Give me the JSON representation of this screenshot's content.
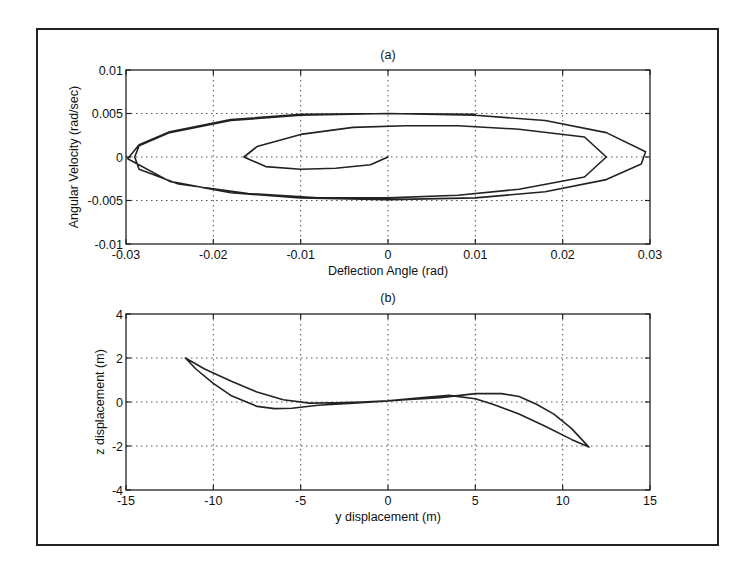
{
  "figure": {
    "panel_a_title": "(a)",
    "panel_b_title": "(b)"
  },
  "chart_data": [
    {
      "type": "line",
      "title": "(a)",
      "xlabel": "Deflection Angle (rad)",
      "ylabel": "Angular Velocity (rad/sec)",
      "xlim": [
        -0.03,
        0.03
      ],
      "ylim": [
        -0.01,
        0.01
      ],
      "xticks": [
        "-0.03",
        "-0.02",
        "-0.01",
        "0",
        "0.01",
        "0.02",
        "0.03"
      ],
      "yticks": [
        "0.01",
        "0.005",
        "0",
        "-0.005",
        "-0.01"
      ],
      "grid": true,
      "legend": null,
      "series": [
        {
          "name": "phase-plane trajectory (spiral out to limit cycle)",
          "points": [
            [
              0,
              0
            ],
            [
              -0.002,
              -0.0009
            ],
            [
              -0.006,
              -0.0013
            ],
            [
              -0.01,
              -0.0014
            ],
            [
              -0.014,
              -0.0011
            ],
            [
              -0.0165,
              0
            ],
            [
              -0.015,
              0.0012
            ],
            [
              -0.01,
              0.0026
            ],
            [
              -0.004,
              0.0034
            ],
            [
              0.002,
              0.0036
            ],
            [
              0.008,
              0.0036
            ],
            [
              0.015,
              0.0032
            ],
            [
              0.0225,
              0.0023
            ],
            [
              0.025,
              0
            ],
            [
              0.0225,
              -0.0023
            ],
            [
              0.015,
              -0.0037
            ],
            [
              0.008,
              -0.0044
            ],
            [
              0.0,
              -0.0047
            ],
            [
              -0.008,
              -0.0047
            ],
            [
              -0.016,
              -0.0042
            ],
            [
              -0.024,
              -0.0031
            ],
            [
              -0.0285,
              -0.0014
            ],
            [
              -0.029,
              0
            ],
            [
              -0.0285,
              0.0013
            ],
            [
              -0.025,
              0.0028
            ],
            [
              -0.018,
              0.0042
            ],
            [
              -0.01,
              0.0048
            ],
            [
              0.0,
              0.005
            ],
            [
              0.01,
              0.0048
            ],
            [
              0.018,
              0.0042
            ],
            [
              0.025,
              0.0028
            ],
            [
              0.0295,
              0.0006
            ],
            [
              0.029,
              -0.0008
            ],
            [
              0.025,
              -0.0026
            ],
            [
              0.018,
              -0.004
            ],
            [
              0.01,
              -0.0047
            ],
            [
              0.0,
              -0.0049
            ],
            [
              -0.01,
              -0.0047
            ],
            [
              -0.018,
              -0.0041
            ],
            [
              -0.025,
              -0.0028
            ],
            [
              -0.0298,
              -0.0002
            ],
            [
              -0.0285,
              0.0014
            ],
            [
              -0.025,
              0.0029
            ],
            [
              -0.018,
              0.0043
            ],
            [
              -0.01,
              0.0049
            ],
            [
              0.0,
              0.005
            ],
            [
              0.01,
              0.0049
            ]
          ]
        }
      ]
    },
    {
      "type": "line",
      "title": "(b)",
      "xlabel": "y displacement (m)",
      "ylabel": "z displacement (m)",
      "xlim": [
        -15,
        15
      ],
      "ylim": [
        -4,
        4
      ],
      "xticks": [
        "-15",
        "-10",
        "-5",
        "0",
        "5",
        "10",
        "15"
      ],
      "yticks": [
        "4",
        "2",
        "0",
        "-2",
        "-4"
      ],
      "grid": true,
      "legend": null,
      "series": [
        {
          "name": "y-z trajectory (closed loop, traced multiple times)",
          "points": [
            [
              -11.6,
              2.0
            ],
            [
              -10.5,
              1.5
            ],
            [
              -9,
              0.95
            ],
            [
              -7.5,
              0.45
            ],
            [
              -6,
              0.1
            ],
            [
              -4.5,
              -0.05
            ],
            [
              -3,
              -0.03
            ],
            [
              -1.5,
              0.0
            ],
            [
              0,
              0.05
            ],
            [
              2,
              0.2
            ],
            [
              3.5,
              0.3
            ],
            [
              5,
              0.15
            ],
            [
              6,
              -0.1
            ],
            [
              7.5,
              -0.55
            ],
            [
              9,
              -1.1
            ],
            [
              10.5,
              -1.7
            ],
            [
              11.5,
              -2.05
            ],
            [
              10.5,
              -1.2
            ],
            [
              9.5,
              -0.55
            ],
            [
              8.5,
              -0.1
            ],
            [
              7.5,
              0.25
            ],
            [
              6.5,
              0.38
            ],
            [
              5,
              0.38
            ],
            [
              3,
              0.2
            ],
            [
              1,
              0.1
            ],
            [
              0,
              0.05
            ],
            [
              -2,
              -0.05
            ],
            [
              -4,
              -0.15
            ],
            [
              -5.5,
              -0.28
            ],
            [
              -6.5,
              -0.3
            ],
            [
              -7.5,
              -0.2
            ],
            [
              -9,
              0.3
            ],
            [
              -10,
              0.85
            ],
            [
              -11,
              1.5
            ],
            [
              -11.6,
              2.0
            ]
          ]
        }
      ]
    }
  ]
}
